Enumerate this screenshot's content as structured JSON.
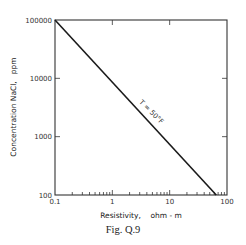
{
  "chart_data": {
    "type": "line",
    "title": "",
    "caption": "Fig. Q.9",
    "xlabel": "Resistivity,    ohm - m",
    "ylabel": "Concentration NaCl,   ppm",
    "xscale": "log",
    "yscale": "log",
    "xlim": [
      0.1,
      100
    ],
    "ylim": [
      100,
      100000
    ],
    "x_ticks": [
      "0.1",
      "1",
      "10",
      "100"
    ],
    "y_ticks": [
      "100",
      "1000",
      "10000",
      "100000"
    ],
    "grid": false,
    "legend": null,
    "series": [
      {
        "name": "T = 50°F",
        "x": [
          0.1,
          65
        ],
        "y": [
          100000,
          100
        ]
      }
    ],
    "annotations": [
      {
        "text": "T = 50°F",
        "x": 4.5,
        "y": 2500,
        "rotation": 45
      }
    ]
  },
  "figure": {
    "caption": "Fig. Q.9"
  }
}
